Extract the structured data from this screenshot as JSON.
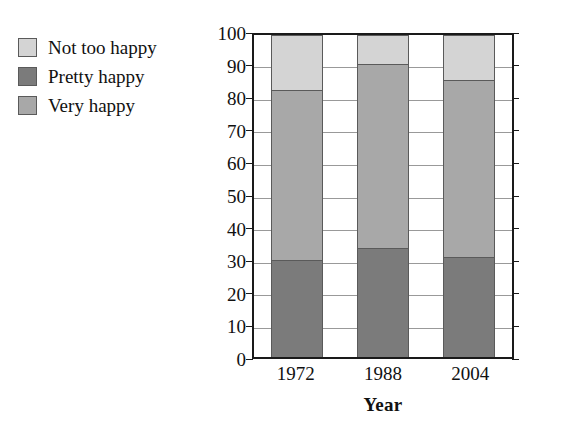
{
  "chart_data": {
    "type": "bar",
    "stacked": true,
    "title": "",
    "xlabel": "Year",
    "ylabel": "Percentage",
    "categories": [
      "1972",
      "1988",
      "2004"
    ],
    "ylim": [
      0,
      100
    ],
    "yticks": [
      0,
      10,
      20,
      30,
      40,
      50,
      60,
      70,
      80,
      90,
      100
    ],
    "ytick_labels": [
      "0",
      "10",
      "20",
      "30",
      "40",
      "50",
      "60",
      "70",
      "80",
      "90",
      "100"
    ],
    "grid": true,
    "legend_position": "upper-left-outside",
    "series": [
      {
        "name": "Very happy",
        "color": "#7b7b7b",
        "values": [
          30,
          34,
          31
        ],
        "stack_order": 0
      },
      {
        "name": "Pretty happy",
        "color": "#a8a8a8",
        "values": [
          53,
          57,
          55
        ],
        "stack_order": 1
      },
      {
        "name": "Not too happy",
        "color": "#d4d4d4",
        "values": [
          17,
          9,
          14
        ],
        "stack_order": 2
      }
    ],
    "cumulative_tops": [
      [
        30,
        83,
        100
      ],
      [
        34,
        91,
        100
      ],
      [
        31,
        86,
        100
      ]
    ]
  },
  "legend": {
    "items": [
      {
        "label": "Not too happy",
        "color": "#d4d4d4"
      },
      {
        "label": "Pretty happy",
        "color": "#7b7b7b"
      },
      {
        "label": "Very happy",
        "color": "#a8a8a8"
      }
    ]
  },
  "colors": {
    "not_too_happy": "#d4d4d4",
    "pretty_happy": "#7b7b7b",
    "very_happy": "#a8a8a8",
    "axis": "#1a1a1a",
    "grid": "#999999",
    "background": "#ffffff"
  }
}
